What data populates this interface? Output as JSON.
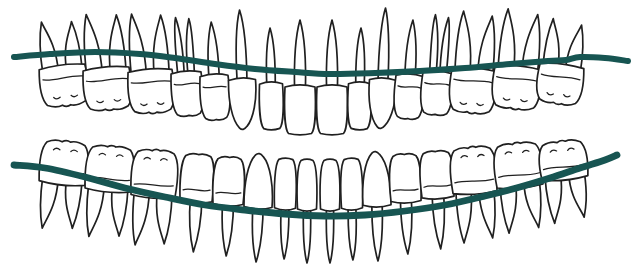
{
  "canvas": {
    "width": 637,
    "height": 278,
    "background": "#ffffff"
  },
  "style": {
    "outline_color": "#202020",
    "outline_width": 1.7,
    "detail_width": 1.25,
    "tooth_fill": "#ffffff",
    "wire_color": "#175552",
    "upper_wire_width": 6.0,
    "lower_wire_width": 6.8
  },
  "diagram": {
    "tooth_fields": [
      "type",
      "cx",
      "w",
      "cerv",
      "end",
      "tip",
      "tilt"
    ],
    "upper_arch": {
      "name": "maxillary-arch",
      "teeth": [
        [
          "molar",
          62,
          46,
          67,
          106,
          20,
          -7
        ],
        [
          "molar",
          106,
          46,
          69,
          110,
          13,
          -5
        ],
        [
          "molar",
          150,
          44,
          71,
          113,
          13,
          -4
        ],
        [
          "premolar2",
          186,
          30,
          73,
          116,
          17,
          -4
        ],
        [
          "premolar",
          214,
          28,
          76,
          120,
          22,
          -3
        ],
        [
          "canine",
          242,
          27,
          80,
          130,
          10,
          -2
        ],
        [
          "lateral-incisor",
          271,
          23,
          84,
          130,
          28,
          -1
        ],
        [
          "central-incisor",
          300,
          30,
          87,
          135,
          20,
          0
        ],
        [
          "central-incisor",
          332,
          30,
          87,
          135,
          20,
          0
        ],
        [
          "lateral-incisor",
          360,
          23,
          84,
          130,
          28,
          1
        ],
        [
          "canine",
          383,
          27,
          80,
          129,
          8,
          2
        ],
        [
          "premolar",
          410,
          28,
          76,
          119,
          20,
          3
        ],
        [
          "premolar2",
          438,
          30,
          73,
          115,
          15,
          4
        ],
        [
          "molar",
          474,
          44,
          70,
          113,
          12,
          4
        ],
        [
          "molar",
          518,
          46,
          68,
          109,
          10,
          5
        ],
        [
          "molar",
          562,
          44,
          66,
          104,
          20,
          7
        ]
      ]
    },
    "lower_arch": {
      "name": "mandibular-arch",
      "teeth": [
        [
          "molar",
          62,
          46,
          183,
          141,
          230,
          6
        ],
        [
          "molar",
          108,
          46,
          190,
          146,
          238,
          5
        ],
        [
          "molar",
          153,
          44,
          196,
          150,
          246,
          4
        ],
        [
          "premolar",
          196,
          32,
          201,
          154,
          252,
          3
        ],
        [
          "premolar",
          228,
          30,
          204,
          157,
          256,
          2
        ],
        [
          "canine",
          258,
          28,
          207,
          153,
          262,
          2
        ],
        [
          "lateral-incisor",
          285,
          21,
          208,
          158,
          259,
          1
        ],
        [
          "central-incisor",
          307,
          19,
          209,
          159,
          263,
          0
        ],
        [
          "central-incisor",
          330,
          19,
          209,
          159,
          263,
          0
        ],
        [
          "lateral-incisor",
          352,
          21,
          208,
          158,
          260,
          -1
        ],
        [
          "canine",
          377,
          28,
          205,
          151,
          261,
          -1
        ],
        [
          "premolar",
          406,
          30,
          201,
          154,
          254,
          -2
        ],
        [
          "premolar",
          438,
          32,
          197,
          151,
          249,
          -3
        ],
        [
          "molar",
          475,
          44,
          192,
          147,
          242,
          -4
        ],
        [
          "molar",
          520,
          46,
          186,
          143,
          232,
          -5
        ],
        [
          "molar",
          565,
          46,
          178,
          141,
          222,
          -6
        ]
      ]
    },
    "upper_wire": {
      "name": "upper-occlusal-curve",
      "points": [
        [
          14,
          57
        ],
        [
          50,
          54
        ],
        [
          95,
          52
        ],
        [
          140,
          54
        ],
        [
          175,
          58
        ],
        [
          215,
          64
        ],
        [
          255,
          69
        ],
        [
          295,
          72
        ],
        [
          330,
          74
        ],
        [
          375,
          73
        ],
        [
          420,
          71
        ],
        [
          465,
          68
        ],
        [
          510,
          64
        ],
        [
          548,
          61
        ],
        [
          566,
          60
        ],
        [
          580,
          57
        ],
        [
          605,
          58
        ],
        [
          628,
          61
        ]
      ]
    },
    "lower_wire": {
      "name": "lower-occlusal-curve",
      "points": [
        [
          14,
          165
        ],
        [
          45,
          168
        ],
        [
          85,
          177
        ],
        [
          125,
          188
        ],
        [
          165,
          197
        ],
        [
          205,
          205
        ],
        [
          245,
          210
        ],
        [
          285,
          214
        ],
        [
          325,
          216
        ],
        [
          365,
          215
        ],
        [
          405,
          211
        ],
        [
          445,
          205
        ],
        [
          485,
          196
        ],
        [
          520,
          187
        ],
        [
          550,
          178
        ],
        [
          580,
          168
        ],
        [
          605,
          160
        ],
        [
          617,
          155
        ]
      ]
    }
  }
}
